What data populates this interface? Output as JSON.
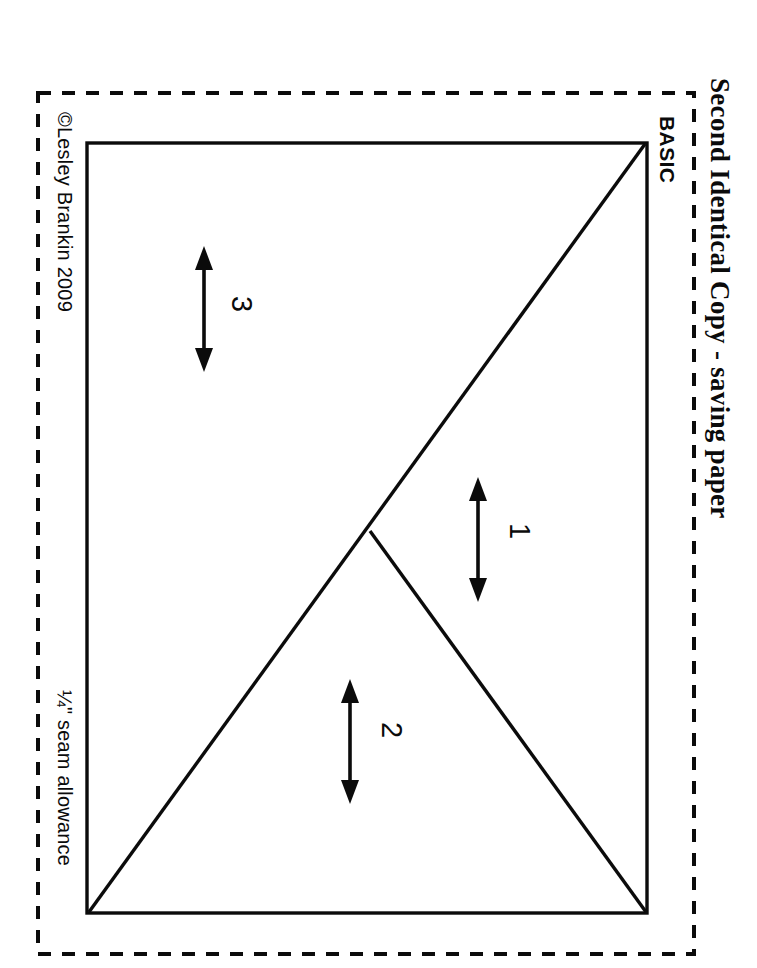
{
  "sheet": {
    "title": "Second Identical Copy - saving paper",
    "copyright": "©Lesley Brankin 2009",
    "seam_allowance_note": "¼\" seam allowance",
    "background_color": "#ffffff",
    "ink_color": "#0b0b0b"
  },
  "block": {
    "name": "BASIC",
    "outline_shape": "rectangle",
    "cut_line_style": "dashed",
    "sew_line_style": "solid"
  },
  "pieces": [
    {
      "id": "1",
      "label": "1",
      "grain_arrow": "double-headed-vertical"
    },
    {
      "id": "2",
      "label": "2",
      "grain_arrow": "double-headed-vertical"
    },
    {
      "id": "3",
      "label": "3",
      "grain_arrow": "double-headed-vertical"
    }
  ],
  "icons": {
    "grain_arrow": "double-arrow-vertical-icon"
  }
}
